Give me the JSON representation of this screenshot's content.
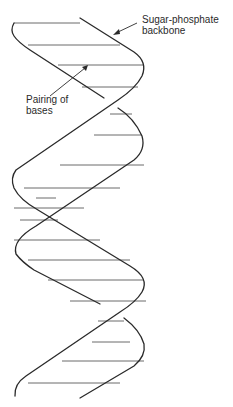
{
  "diagram": {
    "labels": {
      "backbone_line1": "Sugar-phosphate",
      "backbone_line2": "backbone",
      "pairing_line1": "Pairing of",
      "pairing_line2": "bases"
    },
    "colors": {
      "strand": "#2a2a2a",
      "rung": "#6a6a6a",
      "text": "#2a2a2a",
      "background": "#ffffff"
    }
  }
}
